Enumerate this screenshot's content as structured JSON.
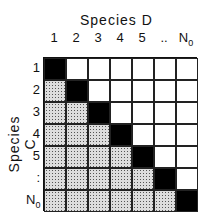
{
  "diagram": {
    "x_axis_title": "Species D",
    "y_axis_title": "Species C",
    "column_labels": [
      "1",
      "2",
      "3",
      "4",
      "5",
      "..",
      "N"
    ],
    "row_labels": [
      "1",
      "2",
      "3",
      "4",
      "5",
      ":",
      "N"
    ],
    "last_label_subscript": "0",
    "grid_size": 7,
    "cell_legend": {
      "diagonal": "black",
      "below_diagonal": "stippled",
      "above_diagonal": "white"
    }
  }
}
